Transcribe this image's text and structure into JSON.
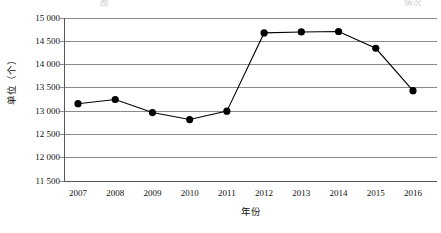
{
  "caption": {
    "text": "图　　　　　　　　　　　　　　　　　　　　　　　　　　　　　　　　情况"
  },
  "chart_data": {
    "type": "line",
    "title": "",
    "xlabel": "年份",
    "ylabel": "单位（个）",
    "categories": [
      "2007",
      "2008",
      "2009",
      "2010",
      "2011",
      "2012",
      "2013",
      "2014",
      "2015",
      "2016"
    ],
    "values": [
      13160,
      13250,
      12970,
      12820,
      13000,
      14680,
      14700,
      14710,
      14350,
      13440
    ],
    "ylim": [
      11500,
      15000
    ],
    "ytick_labels": [
      "15 000",
      "14 500",
      "14 000",
      "13 500",
      "13 000",
      "12 500",
      "12 000",
      "11 500"
    ],
    "ytick_values": [
      15000,
      14500,
      14000,
      13500,
      13000,
      12500,
      12000,
      11500
    ],
    "grid": true,
    "legend": null,
    "marker": "filled-circle",
    "line_color": "#000000",
    "marker_color": "#000000",
    "grid_color": "#8a8a8a",
    "axis_color": "#555555"
  }
}
